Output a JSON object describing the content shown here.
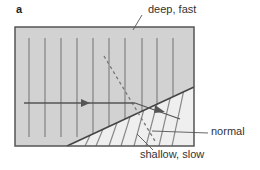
{
  "figure": {
    "panel_label": "a",
    "labels": {
      "deep": "deep, fast",
      "shallow": "shallow, slow",
      "normal": "normal"
    },
    "colors": {
      "deep_fill": "#d2d2d2",
      "shallow_fill": "#efefef",
      "border": "#555555",
      "wavefront": "#888888",
      "ray": "#555555",
      "normal_dashed": "#777777",
      "leader": "#555555"
    },
    "deep_wavefront_x": [
      29,
      45,
      61,
      77,
      93,
      109,
      125,
      142,
      157,
      173
    ]
  }
}
